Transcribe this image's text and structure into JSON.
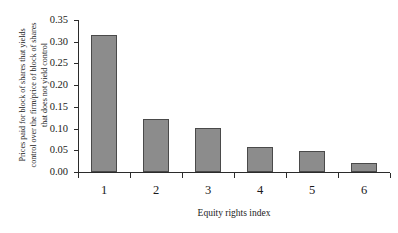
{
  "chart_data": {
    "type": "bar",
    "title": "",
    "subtitle": "",
    "xlabel": "Equity rights index",
    "ylabel": "Prices paid for block of shares that yields control over the firm/price of block of shares that does not yield control",
    "ylabel_lines": [
      "Prices paid for block of shares that yields",
      "control over the firm/price of block of shares",
      "that does not yield control"
    ],
    "categories": [
      "1",
      "2",
      "3",
      "4",
      "5",
      "6"
    ],
    "values": [
      0.315,
      0.122,
      0.101,
      0.058,
      0.048,
      0.021
    ],
    "ylim": [
      0.0,
      0.35
    ],
    "yticks": [
      "0.00",
      "0.05",
      "0.10",
      "0.15",
      "0.20",
      "0.25",
      "0.30",
      "0.35"
    ],
    "ytick_values": [
      0.0,
      0.05,
      0.1,
      0.15,
      0.2,
      0.25,
      0.3,
      0.35
    ],
    "xticks": [
      "1",
      "2",
      "3",
      "4",
      "5",
      "6"
    ],
    "grid": false,
    "legend": false,
    "legend_position": "none",
    "bar_color": "#8c8c8c",
    "bar_border_color": "#4a4a4a",
    "axis_color": "#2b2b2b",
    "background_color": "#ffffff"
  }
}
